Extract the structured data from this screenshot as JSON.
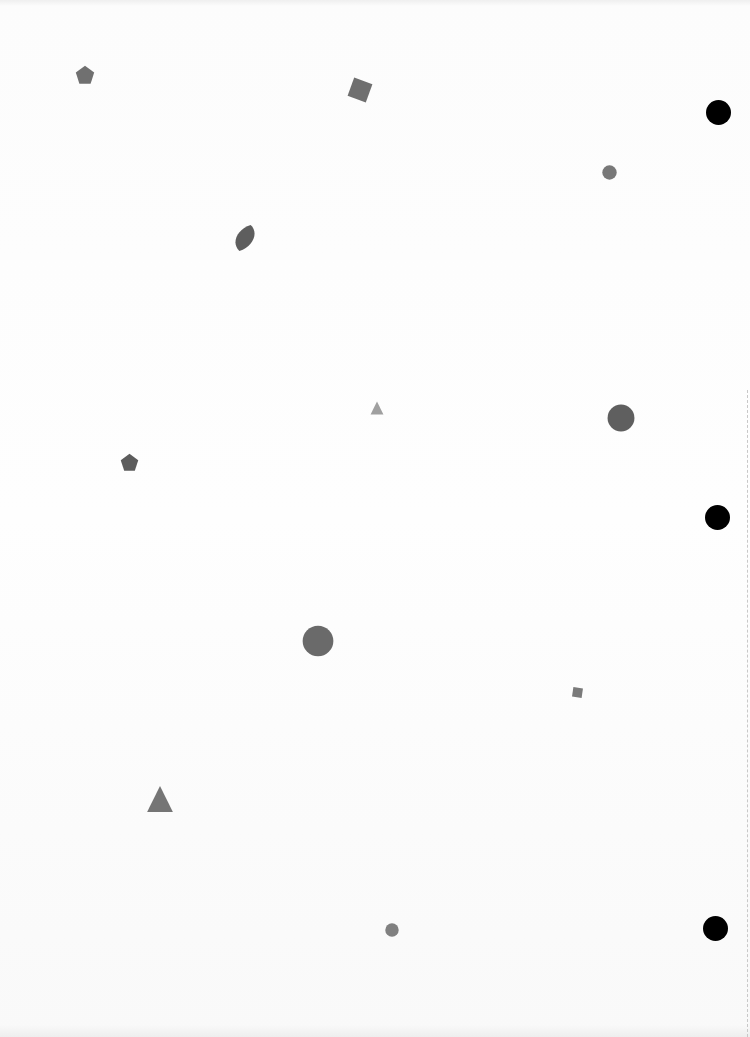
{
  "page": {
    "background": "#fdfdfd"
  },
  "colors": {
    "shape_gray": "#6e6e6e",
    "shape_dark_gray": "#5f5f5f",
    "shape_light_gray": "#9a9a9a",
    "punch_hole": "#000000"
  },
  "shapes": [
    {
      "type": "pentagon",
      "x": 85,
      "y": 75,
      "size": 20,
      "color": "#707070"
    },
    {
      "type": "square",
      "x": 360,
      "y": 90,
      "size": 22,
      "rotation": 20,
      "color": "#6f6f6f"
    },
    {
      "type": "circle",
      "x": 609,
      "y": 172,
      "size": 15,
      "color": "#787878"
    },
    {
      "type": "leaf",
      "x": 245,
      "y": 238,
      "size": 28,
      "color": "#5e5e5e"
    },
    {
      "type": "triangle",
      "x": 377,
      "y": 408,
      "size": 14,
      "color": "#a0a0a0"
    },
    {
      "type": "circle",
      "x": 621,
      "y": 418,
      "size": 28,
      "color": "#5f5f5f"
    },
    {
      "type": "pentagon",
      "x": 129,
      "y": 462,
      "size": 19,
      "color": "#5c5c5c"
    },
    {
      "type": "circle",
      "x": 318,
      "y": 641,
      "size": 32,
      "color": "#6a6a6a"
    },
    {
      "type": "square",
      "x": 577,
      "y": 692,
      "size": 11,
      "rotation": 8,
      "color": "#7a7a7a"
    },
    {
      "type": "triangle",
      "x": 160,
      "y": 799,
      "size": 28,
      "color": "#757575"
    },
    {
      "type": "circle",
      "x": 392,
      "y": 930,
      "size": 14,
      "color": "#808080"
    }
  ],
  "punch_holes": [
    {
      "x": 718,
      "y": 112,
      "size": 25
    },
    {
      "x": 717,
      "y": 517,
      "size": 25
    },
    {
      "x": 715,
      "y": 928,
      "size": 25
    }
  ]
}
